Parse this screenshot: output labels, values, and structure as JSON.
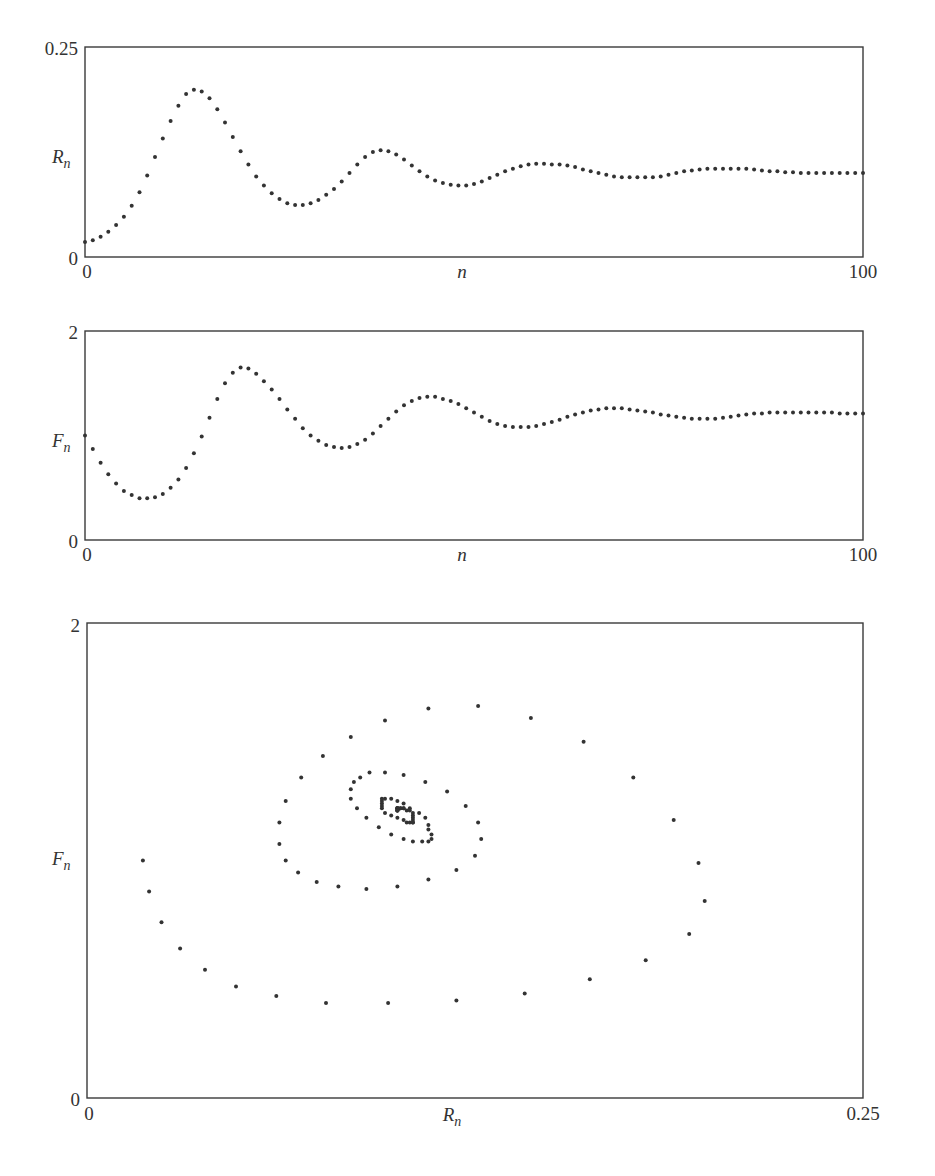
{
  "chart_data": [
    {
      "type": "scatter",
      "title": "",
      "xlabel": "n",
      "ylabel": "R_n",
      "xlim": [
        0,
        100
      ],
      "ylim": [
        0,
        0.25
      ],
      "x_ticks": [
        "0",
        "100"
      ],
      "y_ticks": [
        "0",
        "0.25"
      ],
      "grid": false,
      "series": [
        {
          "name": "R_n",
          "x": "0..100 step 1",
          "values": [
            0.018,
            0.02,
            0.024,
            0.03,
            0.038,
            0.048,
            0.061,
            0.077,
            0.097,
            0.119,
            0.141,
            0.162,
            0.18,
            0.194,
            0.199,
            0.197,
            0.189,
            0.176,
            0.16,
            0.143,
            0.126,
            0.11,
            0.096,
            0.085,
            0.076,
            0.069,
            0.064,
            0.062,
            0.062,
            0.064,
            0.068,
            0.074,
            0.081,
            0.09,
            0.1,
            0.11,
            0.119,
            0.125,
            0.127,
            0.126,
            0.122,
            0.116,
            0.109,
            0.102,
            0.096,
            0.091,
            0.088,
            0.086,
            0.085,
            0.085,
            0.087,
            0.09,
            0.094,
            0.098,
            0.102,
            0.105,
            0.108,
            0.11,
            0.111,
            0.111,
            0.11,
            0.11,
            0.109,
            0.107,
            0.104,
            0.102,
            0.1,
            0.098,
            0.096,
            0.095,
            0.095,
            0.095,
            0.095,
            0.095,
            0.096,
            0.098,
            0.1,
            0.102,
            0.103,
            0.104,
            0.105,
            0.105,
            0.105,
            0.105,
            0.105,
            0.105,
            0.104,
            0.103,
            0.102,
            0.102,
            0.101,
            0.101,
            0.1,
            0.1,
            0.1,
            0.1,
            0.1,
            0.1,
            0.1,
            0.1,
            0.1
          ]
        }
      ]
    },
    {
      "type": "scatter",
      "title": "",
      "xlabel": "n",
      "ylabel": "F_n",
      "xlim": [
        0,
        100
      ],
      "ylim": [
        0,
        2
      ],
      "x_ticks": [
        "0",
        "100"
      ],
      "y_ticks": [
        "0",
        "2"
      ],
      "grid": false,
      "series": [
        {
          "name": "F_n",
          "x": "0..100 step 1",
          "values": [
            1.0,
            0.87,
            0.74,
            0.63,
            0.54,
            0.47,
            0.43,
            0.4,
            0.4,
            0.41,
            0.44,
            0.5,
            0.58,
            0.69,
            0.83,
            0.99,
            1.17,
            1.35,
            1.5,
            1.6,
            1.65,
            1.64,
            1.59,
            1.52,
            1.44,
            1.35,
            1.25,
            1.16,
            1.07,
            1.0,
            0.95,
            0.91,
            0.89,
            0.88,
            0.89,
            0.92,
            0.96,
            1.02,
            1.09,
            1.16,
            1.23,
            1.29,
            1.33,
            1.36,
            1.37,
            1.37,
            1.35,
            1.33,
            1.3,
            1.26,
            1.22,
            1.18,
            1.14,
            1.11,
            1.09,
            1.08,
            1.08,
            1.08,
            1.09,
            1.11,
            1.13,
            1.15,
            1.18,
            1.2,
            1.22,
            1.24,
            1.25,
            1.26,
            1.26,
            1.26,
            1.25,
            1.24,
            1.23,
            1.22,
            1.2,
            1.19,
            1.18,
            1.17,
            1.16,
            1.16,
            1.16,
            1.16,
            1.17,
            1.18,
            1.19,
            1.2,
            1.21,
            1.21,
            1.22,
            1.22,
            1.22,
            1.22,
            1.22,
            1.22,
            1.22,
            1.22,
            1.22,
            1.21,
            1.21,
            1.21,
            1.21
          ]
        }
      ]
    },
    {
      "type": "scatter",
      "title": "",
      "xlabel": "R_n",
      "ylabel": "F_n",
      "xlim": [
        0,
        0.25
      ],
      "ylim": [
        0,
        2
      ],
      "x_ticks": [
        "0",
        "0.25"
      ],
      "y_ticks": [
        "0",
        "2"
      ],
      "grid": false,
      "series": [
        {
          "name": "(R_n, F_n) phase trajectory",
          "x_source": "R_n values",
          "y_source": "F_n values",
          "note": "spiral converging to ~(0.10, 1.2)"
        }
      ]
    }
  ],
  "plots": {
    "top": {
      "ymax_label": "0.25",
      "ymin_label": "0",
      "xmin_label": "0",
      "xmax_label": "100",
      "ylabel_main": "R",
      "ylabel_sub": "n",
      "xlabel": "n"
    },
    "middle": {
      "ymax_label": "2",
      "ymin_label": "0",
      "xmin_label": "0",
      "xmax_label": "100",
      "ylabel_main": "F",
      "ylabel_sub": "n",
      "xlabel": "n"
    },
    "bottom": {
      "ymax_label": "2",
      "ymin_label": "0",
      "xmin_label": "0",
      "xmax_label": "0.25",
      "ylabel_main": "F",
      "ylabel_sub": "n",
      "xlabel_main": "R",
      "xlabel_sub": "n"
    }
  },
  "colors": {
    "dot": "#333333",
    "frame": "#3a3a3a",
    "background": "#ffffff"
  }
}
